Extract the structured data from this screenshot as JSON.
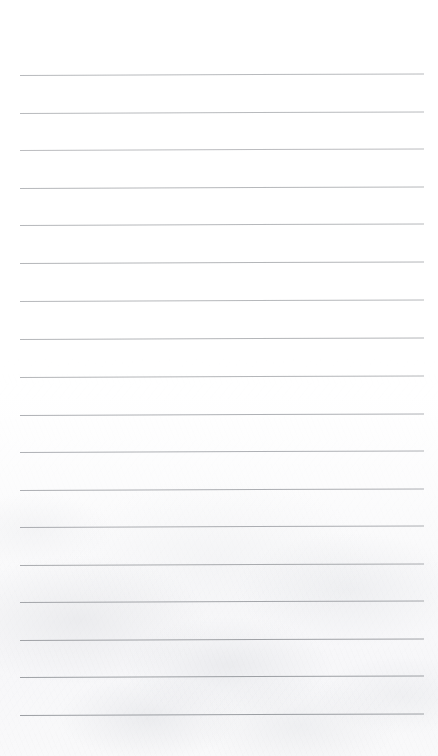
{
  "document": {
    "kind": "scanned-ruled-paper",
    "page_width": 438,
    "page_height": 756,
    "background_color": "#ffffff",
    "orientation": "portrait",
    "written_text": "",
    "text_content_present": false,
    "note": "blank lined writing paper, no handwriting or printed text"
  },
  "ruling": {
    "line_count": 18,
    "line_color": "#8d9095",
    "line_thickness_px": 1,
    "left_margin_px": 20,
    "right_edge_px": 424,
    "line_length_px": 404,
    "first_line_y_px": 75,
    "line_spacing_px": 37.6,
    "skew_degrees": -0.22,
    "margin_rule_present": false,
    "top_margin_px": 75,
    "bottom_margin_px": 41,
    "lines": [
      {
        "index": 1,
        "y": 75,
        "opacity": 0.62
      },
      {
        "index": 2,
        "y": 113,
        "opacity": 0.62
      },
      {
        "index": 3,
        "y": 150,
        "opacity": 0.6
      },
      {
        "index": 4,
        "y": 188,
        "opacity": 0.64
      },
      {
        "index": 5,
        "y": 225,
        "opacity": 0.64
      },
      {
        "index": 6,
        "y": 263,
        "opacity": 0.66
      },
      {
        "index": 7,
        "y": 301,
        "opacity": 0.64
      },
      {
        "index": 8,
        "y": 339,
        "opacity": 0.66
      },
      {
        "index": 9,
        "y": 377,
        "opacity": 0.66
      },
      {
        "index": 10,
        "y": 415,
        "opacity": 0.7
      },
      {
        "index": 11,
        "y": 452,
        "opacity": 0.7
      },
      {
        "index": 12,
        "y": 490,
        "opacity": 0.72
      },
      {
        "index": 13,
        "y": 527,
        "opacity": 0.72
      },
      {
        "index": 14,
        "y": 565,
        "opacity": 0.74
      },
      {
        "index": 15,
        "y": 602,
        "opacity": 0.78
      },
      {
        "index": 16,
        "y": 640,
        "opacity": 0.82
      },
      {
        "index": 17,
        "y": 677,
        "opacity": 0.84
      },
      {
        "index": 18,
        "y": 715,
        "opacity": 0.86
      }
    ]
  },
  "scan_artifacts": {
    "paper_texture_visible": true,
    "texture_region": "lower-half",
    "texture_tint": "#f7f7f9",
    "vignette": false,
    "page_edge_visible": false
  }
}
